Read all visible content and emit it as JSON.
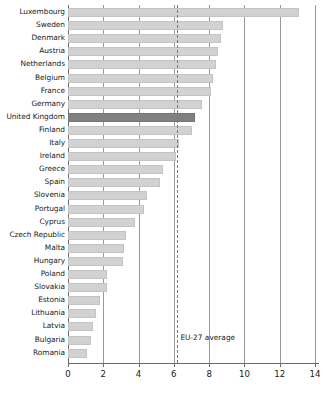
{
  "chart_data": {
    "type": "bar",
    "orientation": "horizontal",
    "title": "",
    "xlabel": "",
    "ylabel": "",
    "xlim": [
      0,
      14
    ],
    "xticks": [
      0,
      2,
      4,
      6,
      8,
      10,
      12,
      14
    ],
    "xtick_labels": [
      "0",
      "2",
      "4",
      "6",
      "8",
      "10",
      "12",
      "14"
    ],
    "grid": true,
    "grid_axis": "x",
    "legend": "none",
    "categories": [
      "Luxembourg",
      "Sweden",
      "Denmark",
      "Austria",
      "Netherlands",
      "Belgium",
      "France",
      "Germany",
      "United Kingdom",
      "Finland",
      "Italy",
      "Ireland",
      "Greece",
      "Spain",
      "Slovenia",
      "Portugal",
      "Cyprus",
      "Czech Republic",
      "Malta",
      "Hungary",
      "Poland",
      "Slovakia",
      "Estonia",
      "Lithuania",
      "Latvia",
      "Bulgaria",
      "Romania"
    ],
    "values": [
      13.1,
      8.8,
      8.7,
      8.5,
      8.4,
      8.2,
      8.1,
      7.6,
      7.2,
      7.0,
      6.3,
      6.1,
      5.4,
      5.2,
      4.5,
      4.3,
      3.8,
      3.3,
      3.2,
      3.1,
      2.2,
      2.2,
      1.8,
      1.6,
      1.4,
      1.3,
      1.1
    ],
    "highlight_category": "United Kingdom",
    "annotations": [
      {
        "name": "eu-27-average",
        "label": "EU-27 average",
        "value": 6.2,
        "style": "dashed-vertical-line"
      }
    ],
    "colors": {
      "bar": "#d2d2d2",
      "bar_highlight": "#808080",
      "gridline": "#9a9a9a",
      "axis": "#6b6b6b",
      "text": "#1a1a1a",
      "background": "#ffffff"
    }
  }
}
